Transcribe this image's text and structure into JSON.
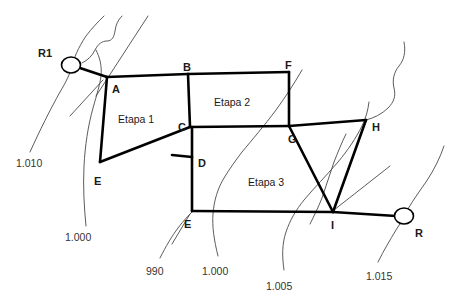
{
  "diagram": {
    "type": "network-staging-diagram",
    "background_color": "#ffffff",
    "line_color": "#000000",
    "contour_color": "#4a4a4a",
    "nodes": [
      {
        "id": "R1",
        "label": "R1",
        "kind": "ring-node",
        "x": 71,
        "y": 65,
        "label_x": 38,
        "label_y": 48
      },
      {
        "id": "A",
        "label": "A",
        "kind": "vertex",
        "x": 107,
        "y": 77,
        "label_x": 112,
        "label_y": 84
      },
      {
        "id": "B",
        "label": "B",
        "kind": "vertex",
        "x": 188,
        "y": 74,
        "label_x": 183,
        "label_y": 62
      },
      {
        "id": "F",
        "label": "F",
        "kind": "vertex",
        "x": 289,
        "y": 72,
        "label_x": 285,
        "label_y": 60
      },
      {
        "id": "C",
        "label": "C",
        "kind": "vertex",
        "x": 190,
        "y": 127,
        "label_x": 178,
        "label_y": 122
      },
      {
        "id": "G",
        "label": "G",
        "kind": "vertex",
        "x": 289,
        "y": 126,
        "label_x": 288,
        "label_y": 134
      },
      {
        "id": "H",
        "label": "H",
        "kind": "vertex",
        "x": 366,
        "y": 120,
        "label_x": 372,
        "label_y": 122
      },
      {
        "id": "D",
        "label": "D",
        "kind": "vertex",
        "x": 192,
        "y": 157,
        "label_x": 198,
        "label_y": 158
      },
      {
        "id": "E1",
        "label": "E",
        "kind": "vertex",
        "x": 100,
        "y": 162,
        "label_x": 94,
        "label_y": 176
      },
      {
        "id": "E2",
        "label": "E",
        "kind": "vertex",
        "x": 192,
        "y": 211,
        "label_x": 184,
        "label_y": 219
      },
      {
        "id": "I",
        "label": "I",
        "kind": "vertex",
        "x": 333,
        "y": 212,
        "label_x": 331,
        "label_y": 220
      },
      {
        "id": "R",
        "label": "R",
        "kind": "ring-node",
        "x": 404,
        "y": 216,
        "label_x": 415,
        "label_y": 228
      }
    ],
    "areas": [
      {
        "id": "etapa1",
        "label": "Etapa 1",
        "label_x": 118,
        "label_y": 114
      },
      {
        "id": "etapa2",
        "label": "Etapa 2",
        "label_x": 214,
        "label_y": 97
      },
      {
        "id": "etapa3",
        "label": "Etapa 3",
        "label_x": 248,
        "label_y": 177
      }
    ],
    "contour_labels": [
      {
        "value": "1.010",
        "x": 16,
        "y": 158
      },
      {
        "value": "1.000",
        "x": 65,
        "y": 232
      },
      {
        "value": "990",
        "x": 146,
        "y": 266
      },
      {
        "value": "1.000",
        "x": 202,
        "y": 266
      },
      {
        "value": "1.005",
        "x": 266,
        "y": 281
      },
      {
        "value": "1.015",
        "x": 366,
        "y": 271
      }
    ]
  }
}
